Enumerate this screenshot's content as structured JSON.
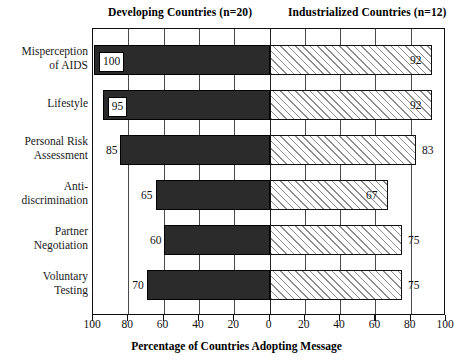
{
  "chart_data": {
    "type": "bar",
    "orientation": "horizontal",
    "layout": "diverging-pyramid",
    "title": "",
    "xlabel": "Percentage of Countries Adopting Message",
    "ylabel": "",
    "xlim": [
      0,
      100
    ],
    "xticks": [
      100,
      80,
      60,
      40,
      20,
      0,
      20,
      40,
      60,
      80,
      100
    ],
    "grid": true,
    "grid_axis": "x",
    "legend_position": "top",
    "categories": [
      "Misperception of AIDS",
      "Lifestyle",
      "Personal Risk Assessment",
      "Anti-discrimination",
      "Partner Negotiation",
      "Voluntary Testing"
    ],
    "series": [
      {
        "name": "Developing Countries (n=20)",
        "side": "left",
        "n": 20,
        "fill": "solid-black",
        "values": [
          100,
          95,
          85,
          65,
          60,
          70
        ]
      },
      {
        "name": "Industrialized Countries (n=12)",
        "side": "right",
        "n": 12,
        "fill": "diagonal-hatch",
        "values": [
          92,
          92,
          83,
          67,
          75,
          75
        ]
      }
    ]
  },
  "headings": {
    "left": "Developing Countries (n=20)",
    "right": "Industrialized Countries (n=12)"
  },
  "categories": [
    {
      "line1": "Misperception",
      "line2": "of AIDS"
    },
    {
      "line1": "Lifestyle",
      "line2": ""
    },
    {
      "line1": "Personal Risk",
      "line2": "Assessment"
    },
    {
      "line1": "Anti-",
      "line2": "discrimination"
    },
    {
      "line1": "Partner",
      "line2": "Negotiation"
    },
    {
      "line1": "Voluntary",
      "line2": "Testing"
    }
  ],
  "left_values": [
    "100",
    "95",
    "85",
    "65",
    "60",
    "70"
  ],
  "right_values": [
    "92",
    "92",
    "83",
    "67",
    "75",
    "75"
  ],
  "tick_labels": [
    "100",
    "80",
    "60",
    "40",
    "20",
    "0",
    "20",
    "40",
    "60",
    "80",
    "100"
  ],
  "axis_title": "Percentage of Countries Adopting Message",
  "colors": {
    "left_bar": "#2b2b2b",
    "right_bar_hatch": "#8d8d8d",
    "frame": "#111111",
    "text": "#111111"
  }
}
